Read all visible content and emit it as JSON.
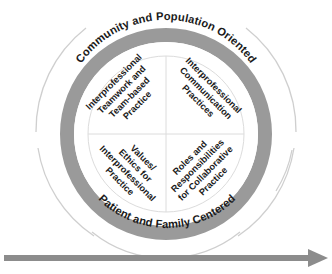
{
  "diagram": {
    "title_outer_top": "Community and Population Oriented",
    "title_outer_bottom": "Patient and Family Centered",
    "colors": {
      "ring_band": "#9a9a9a",
      "outer_arc": "#cfcfcf",
      "inner_circle": "#ffffff",
      "divider": "#d9d9d9",
      "text": "#1a1a1a",
      "arrow": "#8c8c8c",
      "background": "#ffffff"
    },
    "quadrants": [
      {
        "id": "interprofessional-teamwork",
        "position": "top-left",
        "lines": [
          "Interprofessional",
          "Teamwork and",
          "Team-based",
          "Practice"
        ]
      },
      {
        "id": "interprofessional-communication",
        "position": "top-right",
        "lines": [
          "Interprofessional",
          "Communication",
          "Practices"
        ]
      },
      {
        "id": "values-ethics",
        "position": "bottom-left",
        "lines": [
          "Values/",
          "Ethics for",
          "Interprofessional",
          "Practice"
        ]
      },
      {
        "id": "roles-responsibilities",
        "position": "bottom-right",
        "lines": [
          "Roles and",
          "Responsibilities",
          "for Collaborative",
          "Practice"
        ]
      }
    ],
    "progress_arrow": {
      "label": "",
      "direction": "right"
    }
  }
}
